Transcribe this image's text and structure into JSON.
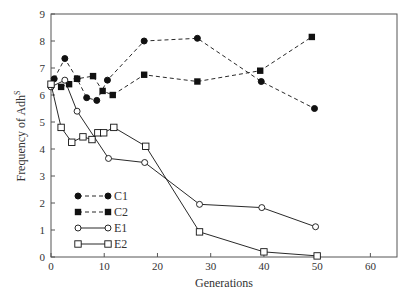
{
  "chart_data": {
    "type": "line",
    "title": "",
    "xlabel": "Generations",
    "ylabel": "Frequency of Adh",
    "ylabel_superscript": "S",
    "xlim": [
      0,
      65
    ],
    "ylim": [
      0,
      9
    ],
    "xticks": [
      0,
      10,
      20,
      30,
      40,
      50,
      60
    ],
    "yticks": [
      0,
      1,
      2,
      3,
      4,
      5,
      6,
      7,
      8,
      9
    ],
    "grid": false,
    "legend_position": "lower-left",
    "series": [
      {
        "name": "C1",
        "marker": "filled-circle",
        "line": "dashed",
        "x": [
          0.6,
          2.6,
          4.9,
          6.7,
          8.6,
          10.6,
          17.5,
          27.5,
          39.5,
          49.5
        ],
        "y": [
          6.6,
          7.35,
          6.6,
          5.9,
          5.8,
          6.55,
          8.0,
          8.1,
          6.5,
          5.5
        ]
      },
      {
        "name": "C2",
        "marker": "filled-square",
        "line": "dashed",
        "x": [
          1.9,
          3.4,
          4.9,
          7.9,
          9.7,
          11.6,
          17.5,
          27.5,
          39.3,
          49.0
        ],
        "y": [
          6.3,
          6.4,
          6.6,
          6.7,
          6.15,
          6.0,
          6.75,
          6.5,
          6.9,
          8.15
        ]
      },
      {
        "name": "E1",
        "marker": "open-circle",
        "line": "solid",
        "x": [
          0,
          2.6,
          4.9,
          10.8,
          17.6,
          27.9,
          39.6,
          49.7
        ],
        "y": [
          6.3,
          6.55,
          5.4,
          3.65,
          3.5,
          1.95,
          1.83,
          1.12
        ]
      },
      {
        "name": "E2",
        "marker": "open-square",
        "line": "solid",
        "x": [
          0,
          1.9,
          3.9,
          6.0,
          7.7,
          8.8,
          9.9,
          11.8,
          17.8,
          27.9,
          40.0,
          50.0
        ],
        "y": [
          6.4,
          4.8,
          4.25,
          4.45,
          4.35,
          4.6,
          4.6,
          4.8,
          4.1,
          0.93,
          0.19,
          0.04
        ]
      }
    ]
  },
  "colors": {
    "axis": "#555555",
    "series": "#111111",
    "background": "#ffffff"
  }
}
